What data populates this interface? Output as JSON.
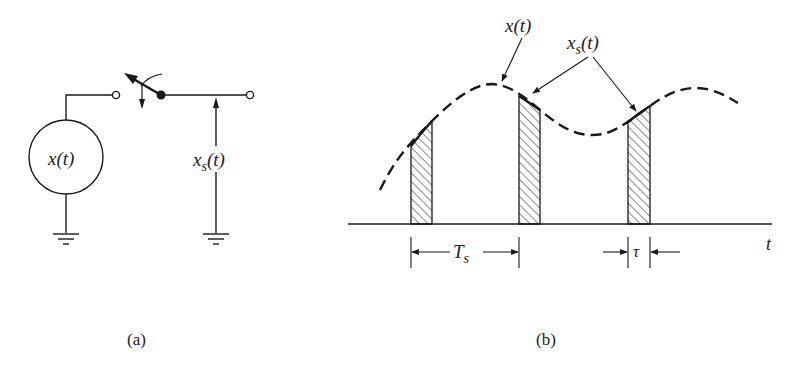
{
  "panel_a": {
    "caption": "(a)",
    "source_label": "x(t)",
    "output_label_main": "x",
    "output_label_sub": "s",
    "output_label_tail": "(t)"
  },
  "panel_b": {
    "caption": "(b)",
    "signal_label": "x(t)",
    "sampled_label_main": "x",
    "sampled_label_sub": "s",
    "sampled_label_tail": "(t)",
    "axis_label": "t",
    "period_label_main": "T",
    "period_label_sub": "s",
    "width_label": "τ"
  },
  "colors": {
    "ink": "#1a1a1a",
    "background": "#ffffff"
  }
}
